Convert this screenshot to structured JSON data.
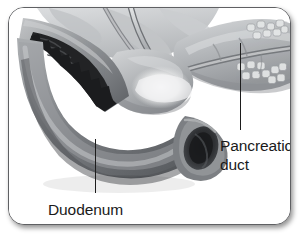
{
  "figure": {
    "name": "pancreatic-duct-duodenum-anatomy",
    "style": "grayscale medical illustration on rounded white card",
    "card": {
      "border_color": "#5f6063",
      "background_color": "#ffffff",
      "corner_radius_px": 16,
      "shadow_color": "rgba(0,0,0,0.42)"
    }
  },
  "labels": {
    "pancreatic_duct": {
      "text": "Pancreatic\nduct",
      "line1": "Pancreatic",
      "line2": "duct",
      "color": "#1a1a1a"
    },
    "duodenum": {
      "text": "Duodenum",
      "color": "#1a1a1a"
    }
  },
  "leader_lines": {
    "color": "#1d1d1d",
    "pancreatic_duct": {
      "x": 231,
      "y_top": 35,
      "y_bottom": 122
    },
    "duodenum": {
      "x": 86,
      "y_top": 131,
      "y_bottom": 185
    }
  },
  "illustration": {
    "palette": {
      "duodenum_wall_light": "#b9bbbd",
      "duodenum_wall_mid": "#8f9295",
      "duodenum_wall_dark": "#6c6f73",
      "duodenum_lumen_dark": "#2a2b2d",
      "duodenum_folds_black": "#1b1c1e",
      "pancreas_light": "#c9cbcd",
      "pancreas_mid": "#a8abae",
      "pancreas_shadow": "#8d9093",
      "duct_light": "#d5d7d9",
      "duct_mid": "#9ea1a4",
      "duct_outline": "#7a7d80",
      "highlight": "#f4f5f6",
      "background": "#ffffff"
    },
    "structures": [
      {
        "name": "duodenum-c-loop",
        "description": "curved descending duodenum forming a C shape on the left, cut open at upper left revealing dark plicae circulares (circular mucosal folds)"
      },
      {
        "name": "duodenum-cut-end",
        "description": "transected distal end at center-right showing open oval lumen with dark interior"
      },
      {
        "name": "pancreas-head",
        "description": "pancreatic head nestled within the duodenal curve, center of image"
      },
      {
        "name": "pancreas-body-tail",
        "description": "pancreas body and tail extending to the upper right with lobular acinar texture"
      },
      {
        "name": "pancreatic-duct",
        "description": "main pancreatic duct running lengthwise through the pancreas toward the duodenum"
      },
      {
        "name": "common-bile-duct",
        "description": "bile duct descending from upper center and joining the pancreatic duct"
      },
      {
        "name": "ampulla-region",
        "description": "bright highlighted junction area where ducts meet the duodenal wall"
      }
    ]
  }
}
